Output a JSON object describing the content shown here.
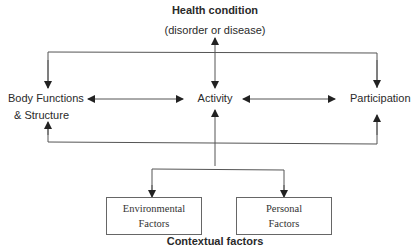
{
  "title": "Health condition",
  "subtitle": "(disorder or disease)",
  "nodes": {
    "body": {
      "line1": "Body Functions",
      "line2": "& Structure"
    },
    "activity": {
      "label": "Activity"
    },
    "participation": {
      "label": "Participation"
    },
    "environmental": {
      "line1": "Environmental",
      "line2": "Factors"
    },
    "personal": {
      "line1": "Personal",
      "line2": "Factors"
    }
  },
  "footer": "Contextual factors",
  "colors": {
    "line": "#555555",
    "text": "#2a2a2a",
    "box_border": "#666666"
  }
}
